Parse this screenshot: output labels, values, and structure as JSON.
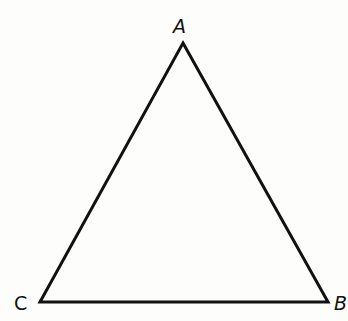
{
  "diagram": {
    "type": "triangle",
    "stroke_color": "#111111",
    "background": "#fdfdfc",
    "vertices": [
      {
        "name": "A",
        "x": 183,
        "y": 43,
        "label_x": 173,
        "label_y": 17,
        "italic": true
      },
      {
        "name": "B",
        "x": 328,
        "y": 302,
        "label_x": 334,
        "label_y": 294,
        "italic": true
      },
      {
        "name": "C",
        "x": 40,
        "y": 302,
        "label_x": 14,
        "label_y": 294,
        "italic": false
      }
    ]
  }
}
